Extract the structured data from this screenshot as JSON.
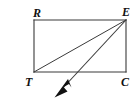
{
  "figure": {
    "problem_number": "47.",
    "shape_name": "rectangle",
    "canvas": {
      "width": 139,
      "height": 106,
      "background": "#ffffff"
    },
    "stroke_color": "#3a3a3a",
    "label_color": "#111111",
    "vertices": [
      {
        "id": "R",
        "label": "R",
        "x": 34,
        "y": 20,
        "corner": "top-left"
      },
      {
        "id": "E",
        "label": "E",
        "x": 126,
        "y": 20,
        "corner": "top-right"
      },
      {
        "id": "C",
        "label": "C",
        "x": 126,
        "y": 72,
        "corner": "bottom-right"
      },
      {
        "id": "T",
        "label": "T",
        "x": 34,
        "y": 72,
        "corner": "bottom-left"
      }
    ],
    "segments": [
      {
        "name": "side-RE",
        "from": "R",
        "to": "E"
      },
      {
        "name": "side-EC",
        "from": "E",
        "to": "C"
      },
      {
        "name": "side-CT",
        "from": "C",
        "to": "T"
      },
      {
        "name": "side-TR",
        "from": "T",
        "to": "R"
      },
      {
        "name": "diagonal-ET",
        "from": "E",
        "to": "T"
      }
    ],
    "ray": {
      "name": "ray-from-E",
      "origin": "E",
      "origin_x": 126,
      "origin_y": 20,
      "tip_x": 55,
      "tip_y": 97,
      "crosses_side": "CT",
      "crossing_x": 76,
      "crossing_y": 72,
      "arrowhead": "solid-triangle",
      "direction": "down-left"
    }
  }
}
